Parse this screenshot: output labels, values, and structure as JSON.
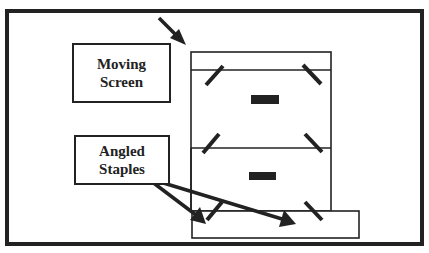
{
  "diagram": {
    "labels": {
      "moving_screen": {
        "line1": "Moving",
        "line2": "Screen"
      },
      "angled_staples": {
        "line1": "Angled",
        "line2": "Staples"
      }
    },
    "colors": {
      "stroke": "#222222",
      "background": "#ffffff"
    },
    "elements": {
      "outer_frame": "outer-frame",
      "screen_frame": "moving-screen-frame",
      "base": "base-platform",
      "staples_count": 6,
      "handles_count": 2,
      "arrows": [
        "moving-screen-pointer-arrow",
        "staple-pointer-arrow-left",
        "staple-pointer-arrow-right"
      ]
    }
  }
}
